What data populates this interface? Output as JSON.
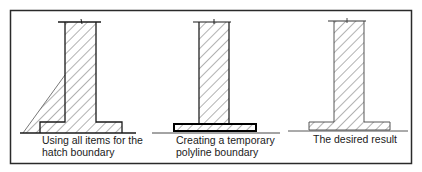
{
  "figure": {
    "colors": {
      "background": "#ffffff",
      "frame": "#2a2a2a",
      "outline": "#1a1a1a",
      "hatch": "#555555"
    },
    "panels": [
      {
        "id": "all-items",
        "caption_lines": [
          "Using all items for the",
          "hatch boundary"
        ]
      },
      {
        "id": "temporary-polyline",
        "caption_lines": [
          "Creating a temporary",
          "polyline boundary"
        ]
      },
      {
        "id": "desired-result",
        "caption_lines": [
          "The desired result"
        ]
      }
    ]
  }
}
